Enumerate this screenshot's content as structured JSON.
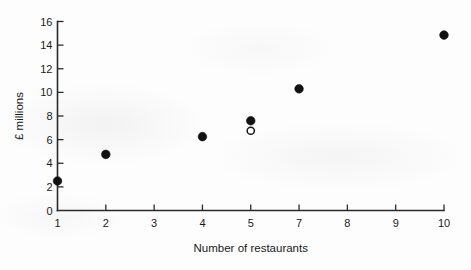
{
  "chart_data": {
    "type": "scatter",
    "title": "",
    "xlabel": "Number of restaurants",
    "ylabel": "£ millions",
    "xlim": [
      1,
      10
    ],
    "ylim": [
      0,
      16
    ],
    "grid": false,
    "legend": "none",
    "x_tick_labels": [
      "1",
      "2",
      "3",
      "4",
      "5",
      "7",
      "8",
      "9",
      "10"
    ],
    "y_tick_labels": [
      "0",
      "2",
      "4",
      "6",
      "8",
      "10",
      "12",
      "14",
      "16"
    ],
    "y_tick_values": [
      0,
      2,
      4,
      6,
      8,
      10,
      12,
      14,
      16
    ],
    "series": [
      {
        "name": "observed",
        "marker": "filled-circle",
        "points": [
          {
            "x": "1",
            "y": 2.5
          },
          {
            "x": "2",
            "y": 4.75
          },
          {
            "x": "4",
            "y": 6.25
          },
          {
            "x": "5",
            "y": 7.6
          },
          {
            "x": "7",
            "y": 10.3
          },
          {
            "x": "10",
            "y": 14.85
          }
        ]
      },
      {
        "name": "highlighted",
        "marker": "open-circle",
        "points": [
          {
            "x": "5",
            "y": 6.75
          }
        ]
      }
    ],
    "colors": {
      "marker": "#111111",
      "axis": "#2b2b2b",
      "background": "#fdfdfd"
    }
  }
}
